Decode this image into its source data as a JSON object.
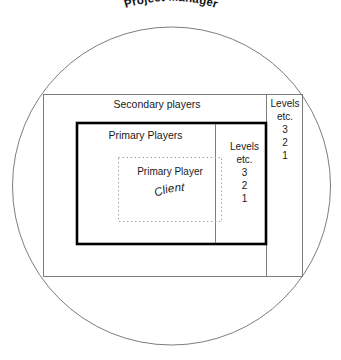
{
  "diagram": {
    "title": "Project Manager",
    "shapes": {
      "circle_label": "Project Manager",
      "outer_rect_label": "Secondary players",
      "thick_rect_label": "Primary Players",
      "dashed_rect_label": "Primary Player",
      "dashed_rect_sublabel": "Client"
    },
    "levels_outer": {
      "heading": "Levels",
      "etc": "etc.",
      "values": [
        "3",
        "2",
        "1"
      ]
    },
    "levels_inner": {
      "heading": "Levels",
      "etc": "etc.",
      "values": [
        "3",
        "2",
        "1"
      ]
    },
    "colors": {
      "stroke_thin": "#666666",
      "stroke_thick": "#000000",
      "stroke_dashed": "#aaaaaa",
      "text": "#1a1a1a",
      "background": "#ffffff"
    }
  }
}
